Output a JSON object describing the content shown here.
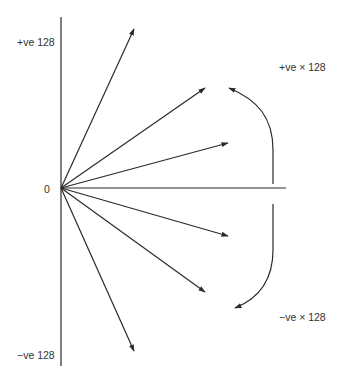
{
  "diagram": {
    "type": "vector-fan",
    "labels": {
      "top_axis": "+ve 128",
      "origin": "0",
      "bottom_axis": "−ve 128",
      "positive_multiplier": "+ve × 128",
      "negative_multiplier": "−ve × 128"
    },
    "origin": {
      "x": 61,
      "y": 188
    },
    "vectors": [
      {
        "name": "vector-up-steep",
        "to": {
          "x": 134,
          "y": 29
        }
      },
      {
        "name": "vector-up-mid",
        "to": {
          "x": 205,
          "y": 88
        }
      },
      {
        "name": "vector-up-shallow",
        "to": {
          "x": 228,
          "y": 143
        }
      },
      {
        "name": "vector-down-shallow",
        "to": {
          "x": 228,
          "y": 236
        }
      },
      {
        "name": "vector-down-mid",
        "to": {
          "x": 205,
          "y": 292
        }
      },
      {
        "name": "vector-down-steep",
        "to": {
          "x": 134,
          "y": 351
        }
      }
    ],
    "colors": {
      "line": "#2a2a2a",
      "text": "#333333",
      "background": "#ffffff"
    }
  }
}
